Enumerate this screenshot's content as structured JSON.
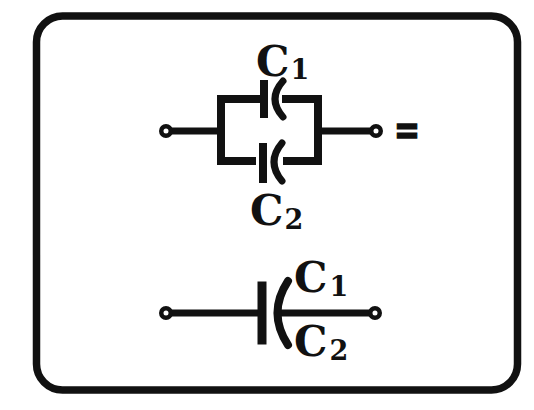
{
  "figure": {
    "ink_color": "#111111",
    "paper_color": "#ffffff",
    "equals_sign": "=",
    "parallel_circuit": {
      "capacitor_1": {
        "symbol": "C",
        "subscript": "1"
      },
      "capacitor_2": {
        "symbol": "C",
        "subscript": "2"
      }
    },
    "equivalent_capacitor": {
      "label_1": {
        "symbol": "C",
        "subscript": "1"
      },
      "label_2": {
        "symbol": "C",
        "subscript": "2"
      }
    }
  }
}
